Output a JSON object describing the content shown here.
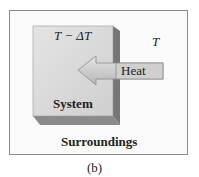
{
  "figure": {
    "system_temp_label": "T − ΔT",
    "surroundings_temp_label": "T",
    "arrow_label": "Heat",
    "system_label": "System",
    "surroundings_label": "Surroundings",
    "caption": "(b)",
    "colors": {
      "box_front": "#d9d9d9",
      "box_side": "#7a7a7a",
      "box_bottom": "#8c8c8c",
      "arrow_fill": "#c9c9c9",
      "frame_border": "#8a8a8a"
    }
  }
}
